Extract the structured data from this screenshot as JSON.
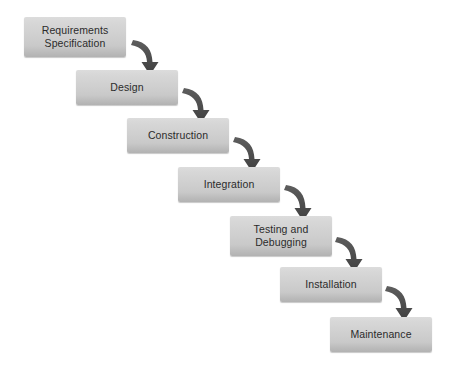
{
  "diagram": {
    "type": "process-flow",
    "background_color": "#ffffff",
    "box_fill_top": "#dcdcdc",
    "box_fill_bottom": "#b2b2b2",
    "box_text_color": "#2b2b2b",
    "arrow_color": "#4d4d4d",
    "phases": [
      {
        "id": "requirements-specification",
        "label": "Requirements\nSpecification",
        "x": 24,
        "y": 17,
        "width": 102,
        "height": 40
      },
      {
        "id": "design",
        "label": "Design",
        "x": 76,
        "y": 70,
        "width": 102,
        "height": 35
      },
      {
        "id": "construction",
        "label": "Construction",
        "x": 127,
        "y": 118,
        "width": 102,
        "height": 35
      },
      {
        "id": "integration",
        "label": "Integration",
        "x": 178,
        "y": 167,
        "width": 102,
        "height": 35
      },
      {
        "id": "testing-and-debugging",
        "label": "Testing and\nDebugging",
        "x": 230,
        "y": 216,
        "width": 102,
        "height": 40
      },
      {
        "id": "installation",
        "label": "Installation",
        "x": 280,
        "y": 267,
        "width": 102,
        "height": 35
      },
      {
        "id": "maintenance",
        "label": "Maintenance",
        "x": 330,
        "y": 317,
        "width": 102,
        "height": 35
      }
    ],
    "arrows": [
      {
        "id": "arrow-requirements-to-design",
        "from": "requirements-specification",
        "to": "design"
      },
      {
        "id": "arrow-design-to-construction",
        "from": "design",
        "to": "construction"
      },
      {
        "id": "arrow-construction-to-integration",
        "from": "construction",
        "to": "integration"
      },
      {
        "id": "arrow-integration-to-testing",
        "from": "integration",
        "to": "testing-and-debugging"
      },
      {
        "id": "arrow-testing-to-installation",
        "from": "testing-and-debugging",
        "to": "installation"
      },
      {
        "id": "arrow-installation-to-maintenance",
        "from": "installation",
        "to": "maintenance"
      }
    ]
  }
}
